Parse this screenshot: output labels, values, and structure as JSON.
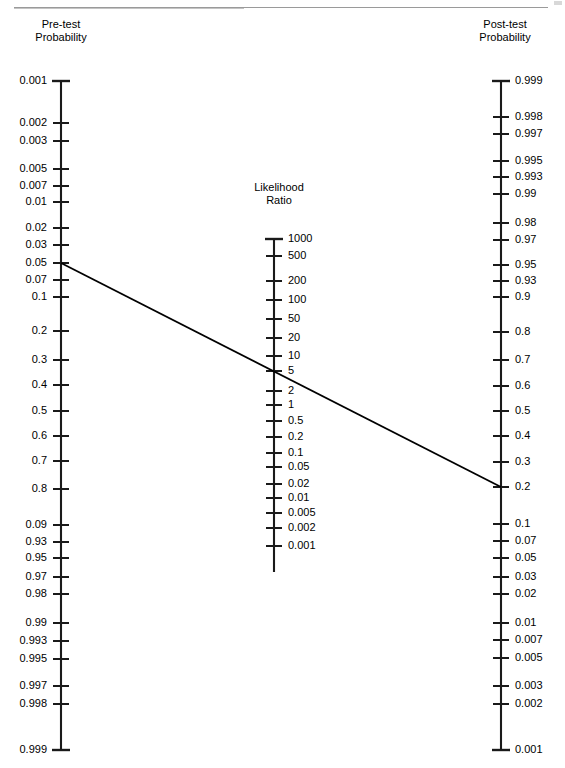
{
  "figure": {
    "kind": "fagan-nomogram",
    "axis_titles": {
      "left": "Pre-test\nProbability",
      "center": "Likelihood\nRatio",
      "right": "Post-test\nProbability"
    },
    "line_color": "#000000",
    "axis_color": "#1a1a1a",
    "rule_color": "#9a9a9a"
  },
  "chart_data": {
    "type": "line",
    "title": "",
    "subtitle": "",
    "xlabel": "",
    "ylabel": "",
    "grid": false,
    "legend_position": "none",
    "annotations": [
      "Pre-test Probability",
      "Likelihood Ratio",
      "Post-test Probability"
    ],
    "axes": [
      {
        "name": "pre-test-probability",
        "label": "Pre-test Probability",
        "position": "left",
        "label_side": "left",
        "pixel_x": 61,
        "pixel_top": 81,
        "pixel_bottom": 750,
        "ticks": [
          {
            "label": "0.001",
            "y": 81
          },
          {
            "label": "0.002",
            "y": 123
          },
          {
            "label": "0.003",
            "y": 141
          },
          {
            "label": "0.005",
            "y": 169
          },
          {
            "label": "0.007",
            "y": 186
          },
          {
            "label": "0.01",
            "y": 202
          },
          {
            "label": "0.02",
            "y": 228
          },
          {
            "label": "0.03",
            "y": 245
          },
          {
            "label": "0.05",
            "y": 263
          },
          {
            "label": "0.07",
            "y": 280
          },
          {
            "label": "0.1",
            "y": 297
          },
          {
            "label": "0.2",
            "y": 331
          },
          {
            "label": "0.3",
            "y": 360
          },
          {
            "label": "0.4",
            "y": 385
          },
          {
            "label": "0.5",
            "y": 411
          },
          {
            "label": "0.6",
            "y": 436
          },
          {
            "label": "0.7",
            "y": 461
          },
          {
            "label": "0.8",
            "y": 489
          },
          {
            "label": "0.09",
            "y": 525
          },
          {
            "label": "0.93",
            "y": 542
          },
          {
            "label": "0.95",
            "y": 558
          },
          {
            "label": "0.97",
            "y": 577
          },
          {
            "label": "0.98",
            "y": 594
          },
          {
            "label": "0.99",
            "y": 623
          },
          {
            "label": "0.993",
            "y": 641
          },
          {
            "label": "0.995",
            "y": 659
          },
          {
            "label": "0.997",
            "y": 686
          },
          {
            "label": "0.998",
            "y": 704
          },
          {
            "label": "0.999",
            "y": 750
          }
        ]
      },
      {
        "name": "likelihood-ratio",
        "label": "Likelihood Ratio",
        "position": "center",
        "label_side": "right",
        "pixel_x": 274,
        "pixel_top": 239,
        "pixel_bottom": 572,
        "ticks": [
          {
            "label": "1000",
            "y": 239
          },
          {
            "label": "500",
            "y": 256
          },
          {
            "label": "200",
            "y": 281
          },
          {
            "label": "100",
            "y": 300
          },
          {
            "label": "50",
            "y": 319
          },
          {
            "label": "20",
            "y": 338
          },
          {
            "label": "10",
            "y": 356
          },
          {
            "label": "5",
            "y": 371
          },
          {
            "label": "2",
            "y": 391
          },
          {
            "label": "1",
            "y": 405
          },
          {
            "label": "0.5",
            "y": 421
          },
          {
            "label": "0.2",
            "y": 437
          },
          {
            "label": "0.1",
            "y": 453
          },
          {
            "label": "0.05",
            "y": 467
          },
          {
            "label": "0.02",
            "y": 484
          },
          {
            "label": "0.01",
            "y": 498
          },
          {
            "label": "0.005",
            "y": 513
          },
          {
            "label": "0.002",
            "y": 528
          },
          {
            "label": "0.001",
            "y": 546
          }
        ]
      },
      {
        "name": "post-test-probability",
        "label": "Post-test Probability",
        "position": "right",
        "label_side": "right",
        "pixel_x": 501,
        "pixel_top": 81,
        "pixel_bottom": 750,
        "ticks": [
          {
            "label": "0.999",
            "y": 81
          },
          {
            "label": "0.998",
            "y": 117
          },
          {
            "label": "0.997",
            "y": 134
          },
          {
            "label": "0.995",
            "y": 161
          },
          {
            "label": "0.993",
            "y": 177
          },
          {
            "label": "0.99",
            "y": 194
          },
          {
            "label": "0.98",
            "y": 223
          },
          {
            "label": "0.97",
            "y": 240
          },
          {
            "label": "0.95",
            "y": 265
          },
          {
            "label": "0.93",
            "y": 281
          },
          {
            "label": "0.9",
            "y": 297
          },
          {
            "label": "0.8",
            "y": 332
          },
          {
            "label": "0.7",
            "y": 360
          },
          {
            "label": "0.6",
            "y": 386
          },
          {
            "label": "0.5",
            "y": 411
          },
          {
            "label": "0.4",
            "y": 436
          },
          {
            "label": "0.3",
            "y": 462
          },
          {
            "label": "0.2",
            "y": 487
          },
          {
            "label": "0.1",
            "y": 524
          },
          {
            "label": "0.07",
            "y": 541
          },
          {
            "label": "0.05",
            "y": 558
          },
          {
            "label": "0.03",
            "y": 577
          },
          {
            "label": "0.02",
            "y": 594
          },
          {
            "label": "0.01",
            "y": 623
          },
          {
            "label": "0.007",
            "y": 640
          },
          {
            "label": "0.005",
            "y": 658
          },
          {
            "label": "0.003",
            "y": 686
          },
          {
            "label": "0.002",
            "y": 704
          },
          {
            "label": "0.001",
            "y": 750
          }
        ]
      }
    ],
    "series": [
      {
        "name": "worked-example-ray",
        "pre_test_probability": 0.05,
        "likelihood_ratio": 5,
        "post_test_probability": 0.2,
        "points": [
          {
            "x": 61,
            "y": 263
          },
          {
            "x": 501,
            "y": 487
          }
        ]
      }
    ]
  }
}
